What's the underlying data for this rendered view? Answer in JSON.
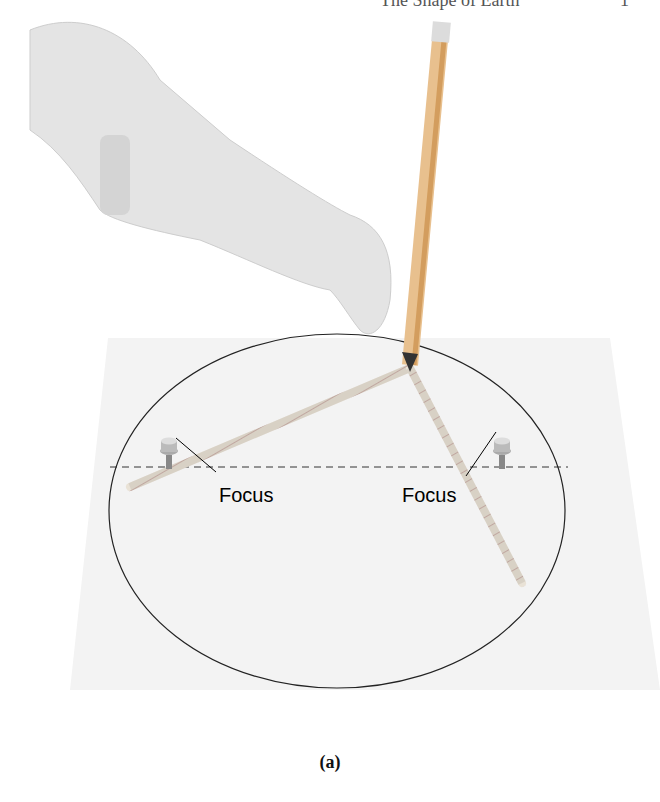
{
  "header": {
    "title": "The Shape of Earth",
    "page": "1"
  },
  "figure": {
    "labels": {
      "focus_left": "Focus",
      "focus_right": "Focus"
    },
    "caption": "(a)"
  }
}
